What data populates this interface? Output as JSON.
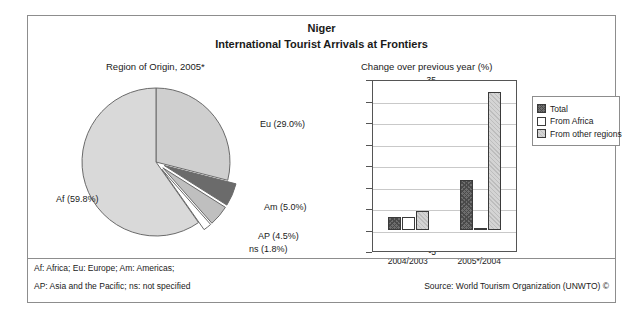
{
  "header": {
    "country": "Niger",
    "subtitle": "International Tourist Arrivals at Frontiers"
  },
  "footer": {
    "note_line1": "Af: Africa; Eu: Europe; Am: Americas;",
    "note_line2": "AP: Asia and the Pacific; ns: not specified",
    "source": "Source: World Tourism Organization (UNWTO) ©"
  },
  "chart_data": [
    {
      "type": "pie",
      "title": "Region of Origin, 2005*",
      "categories": [
        "Af",
        "Eu",
        "Am",
        "AP",
        "ns"
      ],
      "values": [
        59.8,
        29.0,
        5.0,
        4.5,
        1.8
      ],
      "labels": [
        "Af (59.8%)",
        "Eu (29.0%)",
        "Am (5.0%)",
        "AP (4.5%)",
        "ns (1.8%)"
      ],
      "colors": [
        "#d9d9d9",
        "#cfcfcf",
        "#6b6b6b",
        "#bfbfbf",
        "#ffffff"
      ],
      "exploded": [
        "Am",
        "AP",
        "ns"
      ],
      "legend": "none"
    },
    {
      "type": "bar",
      "title": "Change over previous year (%)",
      "categories": [
        "2004/2003",
        "2005*/2004"
      ],
      "series": [
        {
          "name": "Total",
          "values": [
            3.0,
            11.6
          ],
          "color": "#6e6e6e"
        },
        {
          "name": "From Africa",
          "values": [
            2.8,
            0.0
          ],
          "color": "#ffffff"
        },
        {
          "name": "From other regions",
          "values": [
            4.3,
            32.0
          ],
          "color": "#d4d4d4"
        }
      ],
      "ylim": [
        -5,
        35
      ],
      "yticks": [
        35,
        30,
        25,
        20,
        15,
        10,
        5,
        0,
        -5
      ],
      "xlabel": "",
      "ylabel": "",
      "grid": true,
      "legend_position": "right"
    }
  ]
}
